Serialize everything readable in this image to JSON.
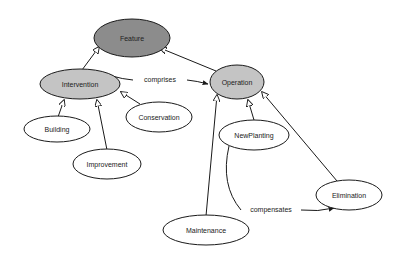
{
  "diagram": {
    "type": "class-hierarchy",
    "colors": {
      "root_fill": "#8c8c8c",
      "parent_fill": "#c4c4c4",
      "leaf_fill": "#ffffff",
      "stroke": "#1a1a1a"
    },
    "nodes": {
      "feature": {
        "label": "Feature",
        "cx": 132,
        "cy": 38,
        "rx": 38,
        "ry": 19,
        "fill": "#8c8c8c"
      },
      "intervention": {
        "label": "Intervention",
        "cx": 80,
        "cy": 84,
        "rx": 40,
        "ry": 15,
        "fill": "#c4c4c4"
      },
      "operation": {
        "label": "Operation",
        "cx": 237,
        "cy": 82,
        "rx": 27,
        "ry": 17,
        "fill": "#c4c4c4"
      },
      "building": {
        "label": "Building",
        "cx": 57,
        "cy": 129,
        "rx": 33,
        "ry": 13,
        "fill": "#ffffff"
      },
      "improvement": {
        "label": "Improvement",
        "cx": 107,
        "cy": 164,
        "rx": 34,
        "ry": 15,
        "fill": "#ffffff"
      },
      "conservation": {
        "label": "Conservation",
        "cx": 159,
        "cy": 117,
        "rx": 33,
        "ry": 15,
        "fill": "#ffffff"
      },
      "newplanting": {
        "label": "NewPlanting",
        "cx": 254,
        "cy": 135,
        "rx": 35,
        "ry": 15,
        "fill": "#ffffff"
      },
      "elimination": {
        "label": "Elimination",
        "cx": 349,
        "cy": 195,
        "rx": 33,
        "ry": 15,
        "fill": "#ffffff"
      },
      "maintenance": {
        "label": "Maintenance",
        "cx": 206,
        "cy": 230,
        "rx": 43,
        "ry": 15,
        "fill": "#ffffff"
      }
    },
    "edges": [
      {
        "from": "Intervention",
        "to": "Feature",
        "kind": "subclass"
      },
      {
        "from": "Operation",
        "to": "Feature",
        "kind": "subclass"
      },
      {
        "from": "Building",
        "to": "Intervention",
        "kind": "subclass"
      },
      {
        "from": "Improvement",
        "to": "Intervention",
        "kind": "subclass"
      },
      {
        "from": "Conservation",
        "to": "Intervention",
        "kind": "subclass"
      },
      {
        "from": "NewPlanting",
        "to": "Operation",
        "kind": "subclass"
      },
      {
        "from": "Maintenance",
        "to": "Operation",
        "kind": "subclass"
      },
      {
        "from": "Elimination",
        "to": "Operation",
        "kind": "subclass"
      },
      {
        "from": "Intervention",
        "to": "Operation",
        "kind": "relation",
        "label": "comprises"
      },
      {
        "from": "NewPlanting",
        "to": "Elimination",
        "kind": "relation",
        "label": "compensates"
      }
    ],
    "edge_labels": {
      "comprises": "comprises",
      "compensates": "compensates"
    }
  }
}
